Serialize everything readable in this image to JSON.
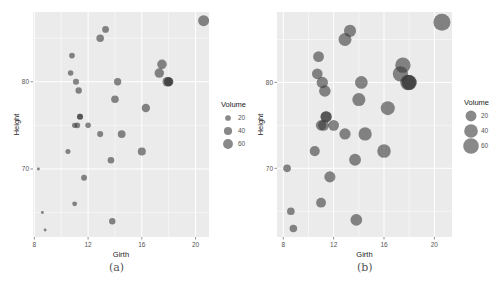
{
  "chart_data": [
    {
      "type": "scatter",
      "panel_label": "(a)",
      "title": "",
      "xlabel": "Girth",
      "ylabel": "Height",
      "xlim": [
        7.9,
        21.0
      ],
      "ylim": [
        62.2,
        88.0
      ],
      "xticks": [
        8,
        12,
        16,
        20
      ],
      "yticks": [
        70,
        80
      ],
      "grid": true,
      "size_variable": "Volume",
      "size_range_px": [
        1.2,
        5.5
      ],
      "legend": {
        "title": "Volume",
        "position": "right",
        "entries": [
          20,
          40,
          60
        ]
      },
      "points": [
        {
          "x": 8.3,
          "y": 70,
          "size": 10.3
        },
        {
          "x": 8.6,
          "y": 65,
          "size": 10.3
        },
        {
          "x": 8.8,
          "y": 63,
          "size": 10.2
        },
        {
          "x": 10.5,
          "y": 72,
          "size": 16.4
        },
        {
          "x": 10.7,
          "y": 81,
          "size": 18.8
        },
        {
          "x": 10.8,
          "y": 83,
          "size": 19.7
        },
        {
          "x": 11.0,
          "y": 66,
          "size": 15.6
        },
        {
          "x": 11.0,
          "y": 75,
          "size": 18.2
        },
        {
          "x": 11.1,
          "y": 80,
          "size": 22.6
        },
        {
          "x": 11.2,
          "y": 75,
          "size": 19.9
        },
        {
          "x": 11.3,
          "y": 79,
          "size": 24.2
        },
        {
          "x": 11.4,
          "y": 76,
          "size": 21.0
        },
        {
          "x": 11.4,
          "y": 76,
          "size": 21.4
        },
        {
          "x": 11.7,
          "y": 69,
          "size": 21.3
        },
        {
          "x": 12.0,
          "y": 75,
          "size": 19.1
        },
        {
          "x": 12.9,
          "y": 74,
          "size": 22.2
        },
        {
          "x": 12.9,
          "y": 85,
          "size": 33.8
        },
        {
          "x": 13.3,
          "y": 86,
          "size": 27.4
        },
        {
          "x": 13.7,
          "y": 71,
          "size": 25.7
        },
        {
          "x": 13.8,
          "y": 64,
          "size": 24.9
        },
        {
          "x": 14.0,
          "y": 78,
          "size": 34.5
        },
        {
          "x": 14.2,
          "y": 80,
          "size": 31.7
        },
        {
          "x": 14.5,
          "y": 74,
          "size": 36.3
        },
        {
          "x": 16.0,
          "y": 72,
          "size": 38.3
        },
        {
          "x": 16.3,
          "y": 77,
          "size": 42.6
        },
        {
          "x": 17.3,
          "y": 81,
          "size": 55.4
        },
        {
          "x": 17.5,
          "y": 82,
          "size": 55.7
        },
        {
          "x": 17.9,
          "y": 80,
          "size": 58.3
        },
        {
          "x": 18.0,
          "y": 80,
          "size": 51.5
        },
        {
          "x": 18.0,
          "y": 80,
          "size": 51.0
        },
        {
          "x": 20.6,
          "y": 87,
          "size": 77.0
        }
      ]
    },
    {
      "type": "scatter",
      "panel_label": "(b)",
      "title": "",
      "xlabel": "Girth",
      "ylabel": "Height",
      "xlim": [
        7.5,
        21.4
      ],
      "ylim": [
        62.0,
        88.2
      ],
      "xticks": [
        8,
        12,
        16,
        20
      ],
      "yticks": [
        70,
        80
      ],
      "grid": true,
      "size_variable": "Volume",
      "size_range_px": [
        3.5,
        8.5
      ],
      "legend": {
        "title": "Volume",
        "position": "right",
        "entries": [
          20,
          40,
          60
        ]
      },
      "points": "same as (a)"
    }
  ],
  "figure": {
    "panel_a_label": "(a)",
    "panel_b_label": "(b)",
    "point_color": "#3a3a3a",
    "point_opacity": 0.6,
    "panel_bg": "#ebebeb",
    "grid_color": "#ffffff"
  }
}
